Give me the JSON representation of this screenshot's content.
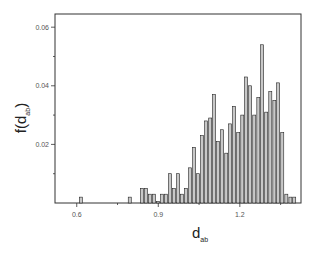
{
  "chart_data": {
    "type": "bar",
    "title": "",
    "xlabel": "d",
    "xlabel_sub": "ab",
    "ylabel": "f(d",
    "ylabel_sub": "ab",
    "ylabel_close": ")",
    "xlim": [
      0.52,
      1.425
    ],
    "ylim": [
      0,
      0.0645
    ],
    "x_ticks": [
      {
        "value": 0.6,
        "label": "0.6"
      },
      {
        "value": 0.9,
        "label": "0.9"
      },
      {
        "value": 1.2,
        "label": "1.2"
      }
    ],
    "x_minor_ticks": [
      0.75,
      1.05,
      1.35
    ],
    "y_ticks": [
      {
        "value": 0.02,
        "label": "0.02"
      },
      {
        "value": 0.04,
        "label": "0.04"
      },
      {
        "value": 0.06,
        "label": "0.06"
      }
    ],
    "y_minor_ticks": [
      0.01,
      0.03,
      0.05
    ],
    "grid": false,
    "legend": null,
    "bin_width": 0.0148,
    "x": [
      0.615,
      0.795,
      0.84,
      0.855,
      0.869,
      0.884,
      0.899,
      0.914,
      0.928,
      0.943,
      0.958,
      0.973,
      0.987,
      1.002,
      1.017,
      1.032,
      1.046,
      1.061,
      1.076,
      1.091,
      1.105,
      1.12,
      1.135,
      1.15,
      1.164,
      1.179,
      1.194,
      1.209,
      1.223,
      1.238,
      1.253,
      1.268,
      1.282,
      1.297,
      1.312,
      1.327,
      1.341,
      1.356
    ],
    "values": [
      0.002,
      0.002,
      0.005,
      0.005,
      0.003,
      0.003,
      0.0005,
      0.003,
      0.003,
      0.01,
      0.005,
      0.01,
      0.003,
      0.005,
      0.012,
      0.019,
      0.01,
      0.023,
      0.028,
      0.029,
      0.037,
      0.021,
      0.025,
      0.017,
      0.027,
      0.033,
      0.024,
      0.03,
      0.043,
      0.04,
      0.03,
      0.036,
      0.054,
      0.031,
      0.038,
      0.035,
      0.041,
      0.024
    ],
    "values_tail": {
      "x": [
        1.371,
        1.386,
        1.4
      ],
      "values": [
        0.003,
        0.002,
        0.002
      ]
    },
    "bar_fill": "#c8c8c8",
    "bar_stroke": "#222222"
  }
}
